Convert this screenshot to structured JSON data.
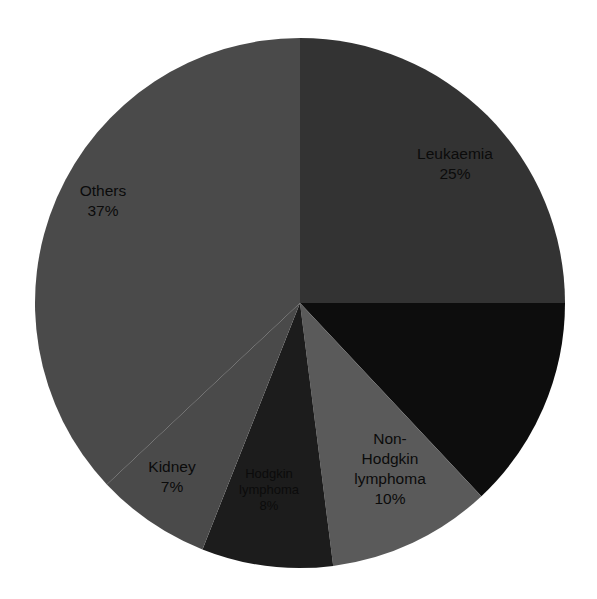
{
  "chart_data": {
    "type": "pie",
    "title": "",
    "subtitle": "",
    "xlabel": "",
    "ylabel": "",
    "legend_position": "none",
    "grid": false,
    "units": "percent",
    "total": 100,
    "start_angle_deg": 0,
    "direction": "clockwise",
    "categories": [
      "Leukaemia",
      "Unlabelled",
      "Non-Hodgkin lymphoma",
      "Hodgkin lymphoma",
      "Kidney",
      "Others"
    ],
    "values": [
      25,
      13,
      10,
      8,
      7,
      37
    ],
    "slices": [
      {
        "key": "leukaemia",
        "name": "Leukaemia",
        "value": 25,
        "percent_text": "25%",
        "color": "#333333",
        "label_line1": "Leukaemia",
        "label_line2": "25%",
        "label_visible": true,
        "label_x": 455,
        "label_y": 155,
        "label_size": "normal"
      },
      {
        "key": "unlabelled-dark",
        "name": "Unlabelled",
        "value": 13,
        "percent_text": "",
        "color": "#0d0d0d",
        "label_line1": "",
        "label_line2": "",
        "label_visible": false,
        "label_x": 0,
        "label_y": 0,
        "label_size": "normal"
      },
      {
        "key": "non-hodgkin-lymphoma",
        "name": "Non-Hodgkin lymphoma",
        "value": 10,
        "percent_text": "10%",
        "color": "#5a5a5a",
        "label_line1": "Non-",
        "label_line2": "Hodgkin",
        "label_line3": "lymphoma",
        "label_line4": "10%",
        "label_visible": true,
        "label_x": 390,
        "label_y": 440,
        "label_size": "normal"
      },
      {
        "key": "hodgkin-lymphoma",
        "name": "Hodgkin lymphoma",
        "value": 8,
        "percent_text": "8%",
        "color": "#1c1c1c",
        "label_line1": "Hodgkin",
        "label_line2": "lymphoma",
        "label_line3": "8%",
        "label_visible": true,
        "label_x": 269,
        "label_y": 475,
        "label_size": "small"
      },
      {
        "key": "kidney",
        "name": "Kidney",
        "value": 7,
        "percent_text": "7%",
        "color": "#4a4a4a",
        "label_line1": "Kidney",
        "label_line2": "7%",
        "label_visible": true,
        "label_x": 172,
        "label_y": 468,
        "label_size": "normal"
      },
      {
        "key": "others",
        "name": "Others",
        "value": 37,
        "percent_text": "37%",
        "color": "#4a4a4a",
        "label_line1": "Others",
        "label_line2": "37%",
        "label_visible": true,
        "label_x": 103,
        "label_y": 192,
        "label_size": "normal"
      }
    ],
    "geometry": {
      "center_x": 300,
      "center_y": 303,
      "radius": 265
    },
    "background_color": "#ffffff"
  }
}
